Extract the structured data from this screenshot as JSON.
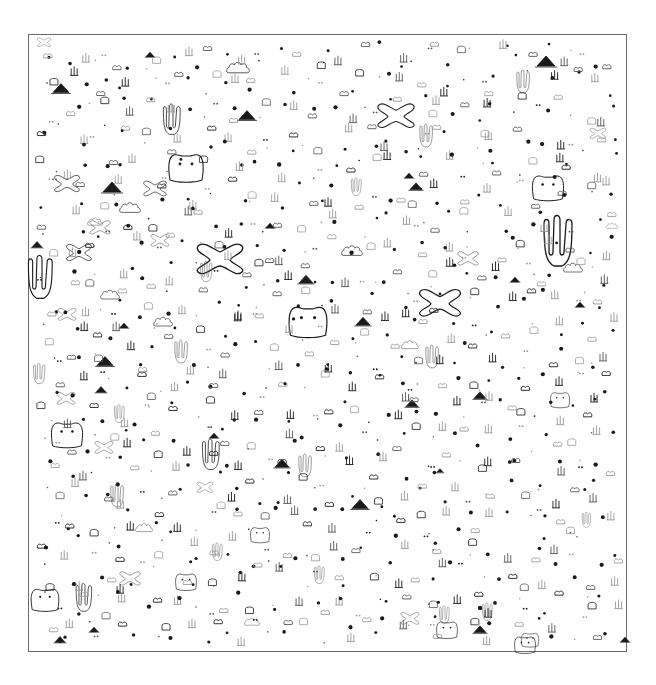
{
  "frame": {
    "x": 28,
    "y": 34,
    "w": 599,
    "h": 618,
    "stroke": "#6a6a6a"
  },
  "colors": {
    "ink": "#1a1a1a",
    "faint": "#9a9a9a",
    "mid": "#555555"
  },
  "large_shapes": [
    {
      "type": "xblob",
      "x": 220,
      "y": 258,
      "s": 1.0
    },
    {
      "type": "xblob",
      "x": 440,
      "y": 302,
      "s": 0.9
    },
    {
      "type": "xblob",
      "x": 396,
      "y": 115,
      "s": 0.8
    },
    {
      "type": "xblob",
      "x": 67,
      "y": 183,
      "s": 0.55
    },
    {
      "type": "xblob",
      "x": 155,
      "y": 188,
      "s": 0.5
    },
    {
      "type": "xblob",
      "x": 79,
      "y": 252,
      "s": 0.55
    },
    {
      "type": "xblob",
      "x": 100,
      "y": 227,
      "s": 0.45
    },
    {
      "type": "xblob",
      "x": 160,
      "y": 240,
      "s": 0.4
    },
    {
      "type": "xblob",
      "x": 468,
      "y": 258,
      "s": 0.45
    },
    {
      "type": "xblob",
      "x": 130,
      "y": 578,
      "s": 0.45
    },
    {
      "type": "xblob",
      "x": 66,
      "y": 398,
      "s": 0.4
    },
    {
      "type": "xblob",
      "x": 67,
      "y": 314,
      "s": 0.4
    },
    {
      "type": "xblob",
      "x": 104,
      "y": 447,
      "s": 0.4
    },
    {
      "type": "xblob",
      "x": 205,
      "y": 487,
      "s": 0.35
    },
    {
      "type": "xblob",
      "x": 410,
      "y": 618,
      "s": 0.4
    },
    {
      "type": "xblob",
      "x": 598,
      "y": 133,
      "s": 0.35
    },
    {
      "type": "xblob",
      "x": 44,
      "y": 42,
      "s": 0.3
    },
    {
      "type": "coral",
      "x": 560,
      "y": 242,
      "s": 1.0
    },
    {
      "type": "coral",
      "x": 42,
      "y": 278,
      "s": 0.85
    },
    {
      "type": "coral",
      "x": 173,
      "y": 120,
      "s": 0.6
    },
    {
      "type": "coral",
      "x": 524,
      "y": 82,
      "s": 0.45
    },
    {
      "type": "coral",
      "x": 427,
      "y": 136,
      "s": 0.45
    },
    {
      "type": "coral",
      "x": 207,
      "y": 272,
      "s": 0.4
    },
    {
      "type": "coral",
      "x": 182,
      "y": 352,
      "s": 0.45
    },
    {
      "type": "coral",
      "x": 433,
      "y": 357,
      "s": 0.45
    },
    {
      "type": "coral",
      "x": 212,
      "y": 455,
      "s": 0.6
    },
    {
      "type": "coral",
      "x": 306,
      "y": 466,
      "s": 0.45
    },
    {
      "type": "coral",
      "x": 118,
      "y": 496,
      "s": 0.45
    },
    {
      "type": "coral",
      "x": 85,
      "y": 598,
      "s": 0.55
    },
    {
      "type": "coral",
      "x": 218,
      "y": 552,
      "s": 0.35
    },
    {
      "type": "coral",
      "x": 320,
      "y": 575,
      "s": 0.35
    },
    {
      "type": "coral",
      "x": 40,
      "y": 374,
      "s": 0.4
    },
    {
      "type": "coral",
      "x": 357,
      "y": 187,
      "s": 0.35
    },
    {
      "type": "coral",
      "x": 120,
      "y": 414,
      "s": 0.35
    },
    {
      "type": "coral",
      "x": 445,
      "y": 615,
      "s": 0.35
    },
    {
      "type": "coral",
      "x": 587,
      "y": 520,
      "s": 0.3
    },
    {
      "type": "coral",
      "x": 488,
      "y": 612,
      "s": 0.35
    },
    {
      "type": "face",
      "x": 186,
      "y": 168,
      "s": 1.0
    },
    {
      "type": "face",
      "x": 308,
      "y": 322,
      "s": 1.1
    },
    {
      "type": "face",
      "x": 548,
      "y": 188,
      "s": 0.9
    },
    {
      "type": "face",
      "x": 67,
      "y": 435,
      "s": 0.9
    },
    {
      "type": "face",
      "x": 45,
      "y": 600,
      "s": 0.8
    },
    {
      "type": "face",
      "x": 186,
      "y": 582,
      "s": 0.6
    },
    {
      "type": "face",
      "x": 260,
      "y": 535,
      "s": 0.55
    },
    {
      "type": "face",
      "x": 525,
      "y": 645,
      "s": 0.6
    },
    {
      "type": "face",
      "x": 560,
      "y": 400,
      "s": 0.55
    },
    {
      "type": "face",
      "x": 447,
      "y": 630,
      "s": 0.6
    },
    {
      "type": "face",
      "x": 530,
      "y": 640,
      "s": 0.5
    },
    {
      "type": "cloud",
      "x": 238,
      "y": 68,
      "s": 0.6
    },
    {
      "type": "cloud",
      "x": 95,
      "y": 222,
      "s": 0.4
    },
    {
      "type": "cloud",
      "x": 130,
      "y": 208,
      "s": 0.55
    },
    {
      "type": "cloud",
      "x": 352,
      "y": 251,
      "s": 0.55
    },
    {
      "type": "cloud",
      "x": 163,
      "y": 322,
      "s": 0.5
    },
    {
      "type": "cloud",
      "x": 110,
      "y": 295,
      "s": 0.5
    },
    {
      "type": "cloud",
      "x": 410,
      "y": 345,
      "s": 0.45
    },
    {
      "type": "cloud",
      "x": 573,
      "y": 268,
      "s": 0.5
    },
    {
      "type": "cloud",
      "x": 612,
      "y": 226,
      "s": 0.3
    },
    {
      "type": "cloud",
      "x": 144,
      "y": 528,
      "s": 0.45
    },
    {
      "type": "cloud",
      "x": 252,
      "y": 622,
      "s": 0.4
    }
  ],
  "mountains": [
    {
      "x": 61,
      "y": 89,
      "s": 0.9
    },
    {
      "x": 112,
      "y": 188,
      "s": 1.0
    },
    {
      "x": 247,
      "y": 116,
      "s": 0.9
    },
    {
      "x": 306,
      "y": 280,
      "s": 0.8
    },
    {
      "x": 363,
      "y": 322,
      "s": 0.8
    },
    {
      "x": 37,
      "y": 245,
      "s": 0.6
    },
    {
      "x": 124,
      "y": 326,
      "s": 0.5
    },
    {
      "x": 546,
      "y": 62,
      "s": 1.0
    },
    {
      "x": 416,
      "y": 187,
      "s": 0.7
    },
    {
      "x": 409,
      "y": 176,
      "s": 0.5
    },
    {
      "x": 270,
      "y": 226,
      "s": 0.5
    },
    {
      "x": 105,
      "y": 362,
      "s": 0.9
    },
    {
      "x": 101,
      "y": 390,
      "s": 0.6
    },
    {
      "x": 214,
      "y": 436,
      "s": 0.5
    },
    {
      "x": 282,
      "y": 464,
      "s": 0.8
    },
    {
      "x": 360,
      "y": 505,
      "s": 0.9
    },
    {
      "x": 480,
      "y": 396,
      "s": 0.7
    },
    {
      "x": 515,
      "y": 280,
      "s": 0.5
    },
    {
      "x": 60,
      "y": 640,
      "s": 0.6
    },
    {
      "x": 94,
      "y": 630,
      "s": 0.5
    },
    {
      "x": 412,
      "y": 404,
      "s": 0.7
    },
    {
      "x": 625,
      "y": 640,
      "s": 0.5
    },
    {
      "x": 480,
      "y": 630,
      "s": 0.7
    },
    {
      "x": 150,
      "y": 55,
      "s": 0.5
    },
    {
      "x": 440,
      "y": 471,
      "s": 0.4
    },
    {
      "x": 580,
      "y": 305,
      "s": 0.5
    }
  ],
  "fill_pattern": {
    "cols": 22,
    "rows": 22,
    "glyph_cycle": [
      "dot",
      "bump",
      "sprout",
      "dot",
      "tiny",
      "pair",
      "bump",
      "dot",
      "face-s",
      "tiny",
      "dot",
      "sprout"
    ],
    "seed": 7
  }
}
